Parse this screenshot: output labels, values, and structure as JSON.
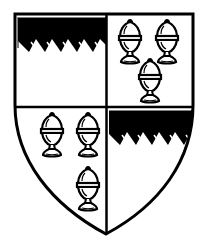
{
  "image": {
    "subject": "heraldic shield quartered",
    "width": 207,
    "height": 250
  },
  "colors": {
    "field": "#ffffff",
    "ink": "#000000"
  },
  "quarters": [
    {
      "position": "dexter-chief",
      "charge": "chief-dancetty"
    },
    {
      "position": "sinister-chief",
      "charge": "three-covered-cups"
    },
    {
      "position": "dexter-base",
      "charge": "three-covered-cups"
    },
    {
      "position": "sinister-base",
      "charge": "chief-dancetty"
    }
  ],
  "cups": {
    "q2": [
      [
        130,
        20
      ],
      [
        167,
        20
      ],
      [
        150,
        60
      ]
    ],
    "q3": [
      [
        52,
        110
      ],
      [
        89,
        110
      ],
      [
        89,
        166
      ]
    ]
  }
}
